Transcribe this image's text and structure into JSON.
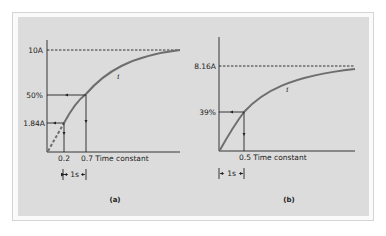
{
  "figure": {
    "panel_a": {
      "caption": "(a)",
      "y_labels": {
        "top": "10A",
        "mid": "50%",
        "low": "1.84A"
      },
      "x_labels": {
        "first": "0.2",
        "second": "0.7 Time constant"
      },
      "curve_label": "i",
      "interval_label": "1s"
    },
    "panel_b": {
      "caption": "(b)",
      "y_labels": {
        "top": "8.16A",
        "mid": "39%"
      },
      "x_labels": {
        "first": "0.5 Time constant"
      },
      "curve_label": "i",
      "interval_label": "1s"
    },
    "colors": {
      "panel_bg": "#dcdcdc",
      "curve": "#6e6e6e",
      "line": "#222222"
    }
  }
}
